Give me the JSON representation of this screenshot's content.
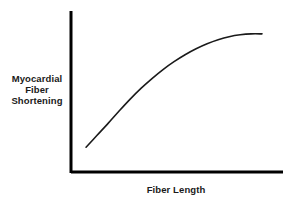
{
  "chart_data": {
    "type": "line",
    "title": "",
    "subtitle": "",
    "xlabel": "Fiber Length",
    "ylabel": "Myocardial Fiber Shortening",
    "ylabel_lines": [
      "Myocardial",
      "Fiber",
      "Shortening"
    ],
    "legend": [],
    "legend_position": "none",
    "grid": false,
    "ticks": false,
    "tick_labels": {
      "x": [],
      "y": []
    },
    "annotations": [],
    "axis_color": "#000000",
    "curve_color": "#1a1a1a",
    "background_color": "#ffffff",
    "xlim": [
      0,
      1
    ],
    "ylim": [
      0,
      1
    ],
    "series": [
      {
        "name": "Myocardial fiber shortening vs fiber length",
        "points": [
          {
            "x": 0.071,
            "y": 0.154
          },
          {
            "x": 0.123,
            "y": 0.228
          },
          {
            "x": 0.175,
            "y": 0.302
          },
          {
            "x": 0.226,
            "y": 0.377
          },
          {
            "x": 0.278,
            "y": 0.451
          },
          {
            "x": 0.33,
            "y": 0.519
          },
          {
            "x": 0.382,
            "y": 0.58
          },
          {
            "x": 0.434,
            "y": 0.636
          },
          {
            "x": 0.486,
            "y": 0.685
          },
          {
            "x": 0.538,
            "y": 0.728
          },
          {
            "x": 0.59,
            "y": 0.765
          },
          {
            "x": 0.642,
            "y": 0.796
          },
          {
            "x": 0.694,
            "y": 0.821
          },
          {
            "x": 0.746,
            "y": 0.84
          },
          {
            "x": 0.798,
            "y": 0.852
          },
          {
            "x": 0.85,
            "y": 0.858
          },
          {
            "x": 0.901,
            "y": 0.858
          }
        ]
      }
    ],
    "geometry": {
      "y_axis_x": 71,
      "y_axis_top": 11,
      "y_axis_bottom": 173,
      "x_axis_y": 172,
      "x_axis_left": 71,
      "x_axis_right": 283,
      "curve_start": [
        86,
        148
      ],
      "curve_end": [
        262,
        46
      ]
    }
  }
}
